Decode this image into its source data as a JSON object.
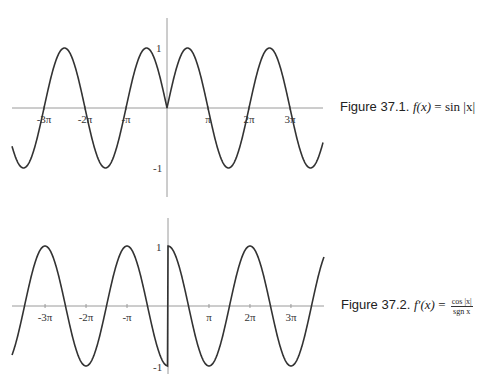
{
  "chart_data": [
    {
      "type": "line",
      "title": "Figure 37.1. f(x) = sin|x|",
      "function": "sin(abs(x))",
      "xlabel": "",
      "ylabel": "",
      "x_ticks": [
        "-3π",
        "-2π",
        "-π",
        "π",
        "2π",
        "3π"
      ],
      "x_tick_values": [
        -9.42,
        -6.28,
        -3.14,
        3.14,
        6.28,
        9.42
      ],
      "y_ticks": [
        "1",
        "-1"
      ],
      "y_tick_values": [
        1,
        -1
      ],
      "xlim": [
        -11.9,
        11.0
      ],
      "ylim": [
        -1.5,
        1.5
      ],
      "grid": false,
      "series": [
        {
          "name": "sin|x|",
          "x": [
            -11.78,
            -10.99,
            -9.42,
            -7.85,
            -6.28,
            -4.71,
            -3.14,
            -1.57,
            0,
            1.57,
            3.14,
            4.71,
            6.28,
            7.85,
            9.42,
            10.99
          ],
          "values": [
            -0.71,
            -1,
            0,
            1,
            0,
            -1,
            0,
            1,
            0,
            1,
            0,
            -1,
            0,
            1,
            0,
            -1
          ]
        }
      ]
    },
    {
      "type": "line",
      "title": "Figure 37.2. f'(x) = cos|x| / sgn x",
      "function": "cos(abs(x))/sign(x)",
      "xlabel": "",
      "ylabel": "",
      "x_ticks": [
        "-3π",
        "-2π",
        "-π",
        "π",
        "2π",
        "3π"
      ],
      "x_tick_values": [
        -9.42,
        -6.28,
        -3.14,
        3.14,
        6.28,
        9.42
      ],
      "y_ticks": [
        "1",
        "-1"
      ],
      "y_tick_values": [
        1,
        -1
      ],
      "xlim": [
        -11.9,
        11.0
      ],
      "ylim": [
        -1.5,
        1.5
      ],
      "grid": false,
      "series": [
        {
          "name": "cos|x|/sgn x",
          "x": [
            -11.78,
            -9.42,
            -6.28,
            -3.14,
            0,
            3.14,
            6.28,
            9.42,
            11.0
          ],
          "values": [
            -0.71,
            1,
            -1,
            1,
            -1,
            -1,
            1,
            -1,
            0.7
          ]
        }
      ]
    }
  ],
  "figures": [
    {
      "caption_label": "Figure 37.1.",
      "caption_lhs": "f(x)",
      "caption_eq": " = ",
      "caption_rhs": "sin |x|",
      "tick_labels": {
        "x": [
          "-3π",
          "-2π",
          "-π",
          "π",
          "2π",
          "3π"
        ],
        "y_pos": "1",
        "y_neg": "-1"
      }
    },
    {
      "caption_label": "Figure 37.2.",
      "caption_lhs": "f′(x)",
      "caption_eq": " = ",
      "caption_num": "cos |x|",
      "caption_den": "sgn x",
      "tick_labels": {
        "x": [
          "-3π",
          "-2π",
          "-π",
          "π",
          "2π",
          "3π"
        ],
        "y_pos": "1",
        "y_neg": "-1"
      }
    }
  ],
  "colors": {
    "curve": "#333333",
    "axis": "#9a9a9a",
    "text": "#222222"
  }
}
